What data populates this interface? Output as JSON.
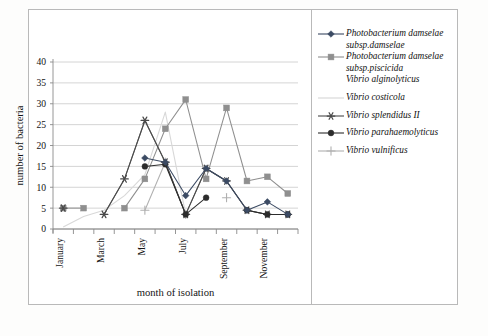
{
  "figure": {
    "background": "#ffffff",
    "frame_color": "#b9b9b9"
  },
  "axes": {
    "y_title": "number of bacteria",
    "x_title": "month of isolation",
    "y_ticks": [
      "0",
      "5",
      "10",
      "15",
      "20",
      "25",
      "30",
      "35",
      "40"
    ],
    "x_tick_labels": [
      "January",
      "",
      "March",
      "",
      "May",
      "",
      "July",
      "",
      "September",
      "",
      "November",
      ""
    ]
  },
  "legend": {
    "entries": [
      {
        "label_lines": [
          "Photobacterium damselae",
          "subsp.damselae"
        ],
        "marker": "diamond",
        "color": "#3b4a63",
        "has_line": true
      },
      {
        "label_lines": [
          "Photobacterium damselae",
          "subsp.piscicida"
        ],
        "marker": "square",
        "color": "#8f8f8f",
        "has_line": true
      },
      {
        "label_lines": [
          "Vibrio alginolyticus"
        ],
        "marker": "none",
        "color": "#6e6e6e",
        "has_line": false
      },
      {
        "label_lines": [
          "Vibrio costicola"
        ],
        "marker": "none",
        "color": "#d8d8d8",
        "has_line": true
      },
      {
        "label_lines": [
          "Vibrio splendidus II"
        ],
        "marker": "asterisk",
        "color": "#4a4a4a",
        "has_line": true
      },
      {
        "label_lines": [
          "Vibrio parahaemolyticus"
        ],
        "marker": "circle",
        "color": "#2c2c2c",
        "has_line": true
      },
      {
        "label_lines": [
          "Vibrio vulnificus"
        ],
        "marker": "plus",
        "color": "#b0b0b0",
        "has_line": true
      }
    ]
  },
  "chart_data": {
    "type": "line",
    "title": "",
    "xlabel": "month of isolation",
    "ylabel": "number of bacteria",
    "ylim": [
      0,
      40
    ],
    "ytick_step": 5,
    "grid": true,
    "legend_position": "right",
    "categories": [
      "January",
      "February",
      "March",
      "April",
      "May",
      "June",
      "July",
      "August",
      "September",
      "October",
      "November",
      "December"
    ],
    "series": [
      {
        "name": "Photobacterium damselae subsp.damselae",
        "marker": "diamond",
        "color": "#3b4a63",
        "values": [
          null,
          null,
          null,
          null,
          17,
          16,
          8,
          14.5,
          11.5,
          4.5,
          6.5,
          3.5
        ]
      },
      {
        "name": "Photobacterium damselae subsp.piscicida",
        "marker": "square",
        "color": "#8f8f8f",
        "values": [
          5,
          5,
          null,
          5,
          12,
          24,
          31,
          12,
          29,
          11.5,
          12.5,
          8.5
        ]
      },
      {
        "name": "Vibrio alginolyticus",
        "marker": "none",
        "color": "#6e6e6e",
        "values": [
          null,
          null,
          3.5,
          12,
          26,
          16,
          3.5,
          14.5,
          11.5,
          4.5,
          3.5,
          3.5
        ]
      },
      {
        "name": "Vibrio costicola",
        "marker": "none",
        "color": "#d8d8d8",
        "values": [
          0.5,
          3,
          4.5,
          8,
          13,
          28,
          3.5,
          null,
          null,
          null,
          null,
          null
        ]
      },
      {
        "name": "Vibrio splendidus II",
        "marker": "asterisk",
        "color": "#4a4a4a",
        "values": [
          5,
          null,
          3.5,
          12,
          26,
          16,
          3.5,
          14.5,
          11.5,
          4.5,
          3.5,
          3.5
        ]
      },
      {
        "name": "Vibrio parahaemolyticus",
        "marker": "circle",
        "color": "#2c2c2c",
        "values": [
          null,
          null,
          null,
          null,
          15,
          15.5,
          3.5,
          7.5,
          null,
          4.5,
          3.5,
          3.5
        ]
      },
      {
        "name": "Vibrio vulnificus",
        "marker": "plus",
        "color": "#b0b0b0",
        "values": [
          null,
          null,
          null,
          null,
          4.5,
          16,
          3.5,
          null,
          7.5,
          null,
          null,
          null
        ]
      }
    ]
  }
}
